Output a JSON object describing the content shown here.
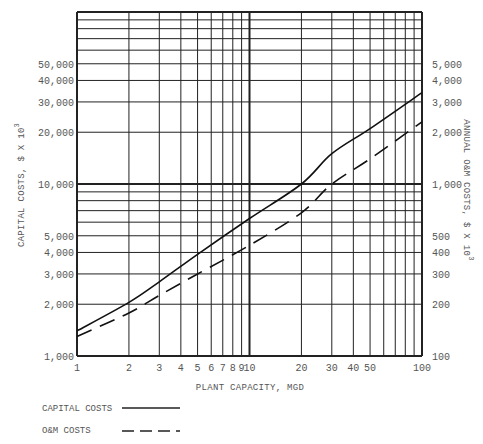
{
  "chart_data": {
    "type": "line",
    "title": "",
    "xlabel": "PLANT CAPACITY, MGD",
    "ylabel": "CAPITAL COSTS, $ X 10^3",
    "y2label": "ANNUAL O&M COSTS, $ X 10^3",
    "xscale": "log",
    "yscale": "log",
    "xlim": [
      1,
      100
    ],
    "ylim": [
      1000,
      100000
    ],
    "y2lim": [
      100,
      10000
    ],
    "grid": true,
    "x_ticks": [
      1,
      2,
      3,
      4,
      5,
      6,
      7,
      8,
      9,
      10,
      20,
      30,
      40,
      50,
      100
    ],
    "x_tick_labels": [
      "1",
      "2",
      "3",
      "4",
      "5",
      "6",
      "7",
      "8",
      "9",
      "10",
      "20",
      "30",
      "40",
      "50",
      "100"
    ],
    "y_ticks": [
      1000,
      2000,
      3000,
      4000,
      5000,
      10000,
      20000,
      30000,
      40000,
      50000
    ],
    "y_tick_labels": [
      "1,000",
      "2,000",
      "3,000",
      "4,000",
      "5,000",
      "10,000",
      "20,000",
      "30,000",
      "40,000",
      "50,000"
    ],
    "y2_ticks": [
      100,
      200,
      300,
      400,
      500,
      1000,
      2000,
      3000,
      4000,
      5000
    ],
    "y2_tick_labels": [
      "100",
      "200",
      "300",
      "400",
      "500",
      "1,000",
      "2,000",
      "3,000",
      "4,000",
      "5,000"
    ],
    "x": [
      1,
      2,
      3,
      5,
      10,
      20,
      30,
      50,
      100
    ],
    "series": [
      {
        "name": "CAPITAL COSTS",
        "axis": "left",
        "style": "solid",
        "values": [
          1400,
          2050,
          2700,
          3900,
          6300,
          10000,
          15000,
          21000,
          34000
        ]
      },
      {
        "name": "O&M COSTS",
        "axis": "right",
        "style": "dashed",
        "values": [
          130,
          178,
          225,
          300,
          440,
          680,
          1000,
          1400,
          2300
        ]
      }
    ],
    "legend": [
      {
        "label": "CAPITAL COSTS",
        "style": "solid"
      },
      {
        "label": "O&M COSTS",
        "style": "dashed"
      }
    ],
    "legend_position": "bottom-left"
  },
  "legend": {
    "capital_label": "CAPITAL COSTS",
    "om_label": "O&M COSTS"
  }
}
